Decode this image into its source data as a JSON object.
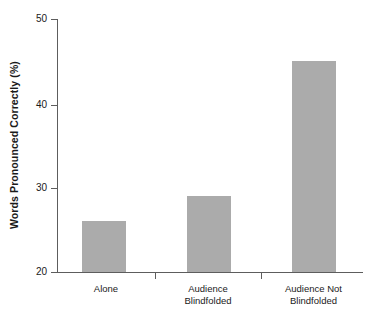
{
  "chart_data": {
    "type": "bar",
    "title": "",
    "xlabel": "",
    "ylabel": "Words Pronounced Correctly (%)",
    "categories": [
      "Alone",
      "Audience\nBlindfolded",
      "Audience Not\nBlindfolded"
    ],
    "values": [
      26,
      29,
      45
    ],
    "ylim": [
      20,
      50
    ],
    "yticks": [
      20,
      30,
      40,
      50
    ],
    "ytick_labels": [
      "20",
      "30",
      "40",
      "50"
    ],
    "grid": false,
    "legend": "none",
    "bar_color": "#ababab",
    "axis_color": "#5d5d5d",
    "background": "#ffffff"
  }
}
